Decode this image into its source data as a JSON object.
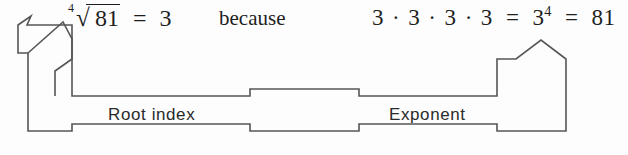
{
  "figure": {
    "background_color": "#fdfdfd",
    "stroke_color": "#555555"
  },
  "equations": {
    "radical": {
      "index": "4",
      "radical_sign": "√",
      "radicand": "81",
      "equals": "=",
      "result": "3",
      "plain_text": "⁴√81 = 3"
    },
    "connective": "because",
    "product": {
      "factors": [
        "3",
        "3",
        "3",
        "3"
      ],
      "operator": "·",
      "equals": "=",
      "power_base": "3",
      "power_exponent": "4",
      "value": "81",
      "plain_text": "3 · 3 · 3 · 3 = 3⁴ = 81"
    }
  },
  "callouts": {
    "left_box_label": "Root index",
    "right_box_label": "Exponent"
  },
  "arrows": {
    "left_arrow_name": "arrow-to-root-index",
    "right_arrow_name": "arrow-to-exponent"
  }
}
